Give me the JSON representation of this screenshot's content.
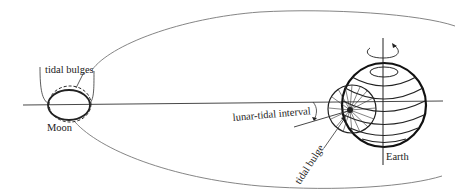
{
  "diagram": {
    "labels": {
      "tidal_bulges": "tidal bulges",
      "moon": "Moon",
      "lunar_tidal_interval": "lunar-tidal interval",
      "tidal_bulge": "tidal bulge",
      "earth": "Earth"
    },
    "colors": {
      "ink": "#222222",
      "orbit": "#777777",
      "background": "#ffffff"
    }
  }
}
